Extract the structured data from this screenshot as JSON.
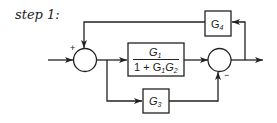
{
  "diagram": {
    "step_label": "step 1:",
    "blocks": {
      "main": {
        "numerator": "G",
        "numerator_sub": "1",
        "denominator_prefix": "1 + G",
        "denominator_sub1": "1",
        "denominator_mid": "G",
        "denominator_sub2": "2"
      },
      "g4": {
        "symbol": "G",
        "sub": "4"
      },
      "g3": {
        "symbol": "G",
        "sub": "3"
      }
    },
    "junctions": {
      "sum1": {
        "sign_top": "+"
      },
      "sum2": {
        "sign_bottom": "−"
      }
    },
    "colors": {
      "line": "#222222",
      "background": "#ffffff"
    }
  }
}
